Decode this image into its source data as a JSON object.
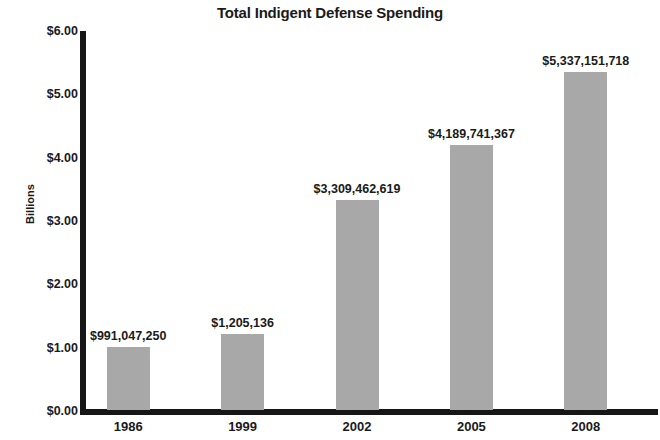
{
  "chart_data": {
    "type": "bar",
    "title": "Total Indigent Defense Spending",
    "xlabel": "",
    "ylabel": "Billions",
    "categories": [
      "1986",
      "1999",
      "2002",
      "2005",
      "2008"
    ],
    "values": [
      0.99104725,
      1.205136,
      3.309462619,
      4.189741367,
      5.337151718
    ],
    "data_labels": [
      "$991,047,250",
      "$1,205,136",
      "$3,309,462,619",
      "$4,189,741,367",
      "$5,337,151,718"
    ],
    "ylim": [
      0,
      6
    ],
    "ytick_values": [
      0,
      1,
      2,
      3,
      4,
      5,
      6
    ],
    "ytick_labels": [
      "$0.00",
      "$1.00",
      "$2.00",
      "$3.00",
      "$4.00",
      "$5.00",
      "$6.00"
    ],
    "grid": false,
    "legend": false,
    "bar_color": "#a8a8a8",
    "axis_color": "#161616",
    "background_color": "#ffffff",
    "text_color": "#1a1a1a"
  }
}
